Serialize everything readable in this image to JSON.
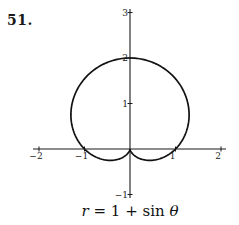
{
  "problem_number": "51.",
  "caption": {
    "lhs": "r",
    "eq": " = 1 + sin ",
    "theta": "θ"
  },
  "chart_data": {
    "type": "line",
    "subtype": "polar",
    "title": "r = 1 + sin θ",
    "equation": "r = 1 + sin(theta)",
    "theta_range": [
      0,
      6.2832
    ],
    "xlim": [
      -2,
      2
    ],
    "ylim": [
      -1,
      3
    ],
    "x_ticks": [
      -2,
      -1,
      1,
      2
    ],
    "y_ticks": [
      -1,
      1,
      2,
      3
    ],
    "x_tick_labels": [
      "-2",
      "-1",
      "1",
      "2"
    ],
    "y_tick_labels": [
      "-1",
      "1",
      "2",
      "3"
    ],
    "grid": false,
    "legend": null,
    "key_points": [
      {
        "x": 0,
        "y": 2,
        "note": "top, theta = pi/2"
      },
      {
        "x": 0,
        "y": 0,
        "note": "cusp, theta = 3pi/2"
      },
      {
        "x": 1,
        "y": 0,
        "note": "theta = 0"
      },
      {
        "x": -1,
        "y": 0,
        "note": "theta = pi"
      }
    ],
    "origin_px": [
      130,
      149
    ],
    "unit_px": 45.5
  }
}
